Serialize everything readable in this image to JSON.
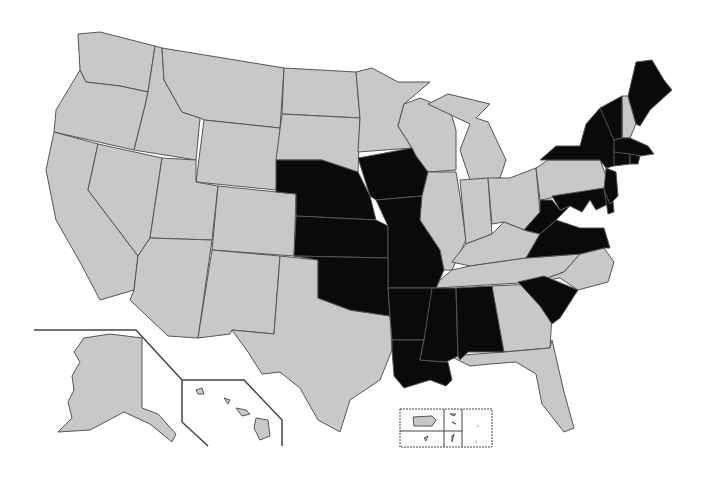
{
  "map": {
    "title": "",
    "colors": {
      "highlighted": "#0a0a0a",
      "default": "#c8c8c8",
      "border": "#555555",
      "background": "#ffffff"
    },
    "highlighted_states": [
      "NE",
      "KS",
      "IA",
      "MO",
      "OK",
      "AR",
      "LA",
      "MS",
      "AL",
      "SC",
      "VA",
      "WV",
      "MD",
      "DE",
      "NJ",
      "NY",
      "VT",
      "ME",
      "MA",
      "CT",
      "RI"
    ],
    "default_states": [
      "WA",
      "OR",
      "CA",
      "ID",
      "NV",
      "MT",
      "WY",
      "UT",
      "AZ",
      "CO",
      "NM",
      "ND",
      "SD",
      "TX",
      "MN",
      "WI",
      "MI",
      "IL",
      "IN",
      "OH",
      "KY",
      "TN",
      "NC",
      "GA",
      "FL",
      "PA",
      "NH",
      "AK",
      "HI"
    ],
    "insets": [
      "Alaska",
      "Hawaii",
      "Puerto Rico and territories"
    ]
  }
}
